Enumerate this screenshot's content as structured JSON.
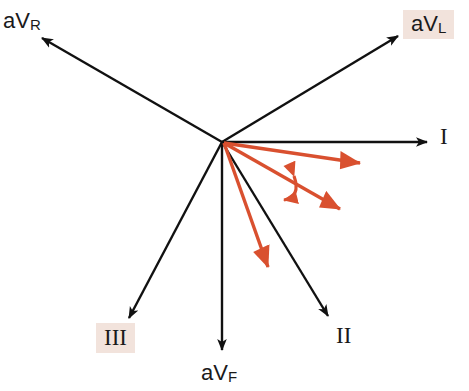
{
  "figure": {
    "background_color": "#ffffff",
    "lead_axis_color": "#111111",
    "vector_color": "#d9502f",
    "highlight_color": "#f2e3dc"
  },
  "origin": {
    "x": 222,
    "y": 142
  },
  "leads": [
    {
      "id": "aVR",
      "label_text": "aV",
      "label_sub": "R",
      "highlighted": false,
      "tip": {
        "x": 40,
        "y": 36
      },
      "angle_deg": -150
    },
    {
      "id": "aVL",
      "label_text": "aV",
      "label_sub": "L",
      "highlighted": true,
      "tip": {
        "x": 400,
        "y": 34
      },
      "angle_deg": -30
    },
    {
      "id": "I",
      "label_text": "I",
      "label_sub": "",
      "highlighted": false,
      "tip": {
        "x": 428,
        "y": 142
      },
      "angle_deg": 0
    },
    {
      "id": "II",
      "label_text": "II",
      "label_sub": "",
      "highlighted": false,
      "tip": {
        "x": 329,
        "y": 318
      },
      "angle_deg": 60
    },
    {
      "id": "aVF",
      "label_text": "aV",
      "label_sub": "F",
      "highlighted": false,
      "tip": {
        "x": 222,
        "y": 352
      },
      "angle_deg": 90
    },
    {
      "id": "III",
      "label_text": "III",
      "label_sub": "",
      "highlighted": true,
      "tip": {
        "x": 127,
        "y": 320
      },
      "angle_deg": 120
    }
  ],
  "vectors": [
    {
      "id": "vector-upper",
      "tip": {
        "x": 378,
        "y": 166
      },
      "angle_deg": 10
    },
    {
      "id": "vector-middle",
      "tip": {
        "x": 358,
        "y": 218
      },
      "angle_deg": 30
    },
    {
      "id": "vector-lower",
      "tip": {
        "x": 278,
        "y": 286
      },
      "angle_deg": 70
    }
  ],
  "angle_arc": {
    "id": "rotation-arc",
    "double_headed": true,
    "start": {
      "x": 293,
      "y": 166
    },
    "end": {
      "x": 272,
      "y": 201
    }
  }
}
